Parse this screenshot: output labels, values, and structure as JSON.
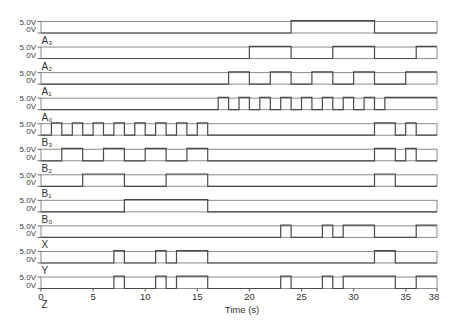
{
  "chart_data": {
    "type": "line",
    "style": "digital-step",
    "title": "",
    "xlabel": "Time (s)",
    "ylabel": "",
    "xlim": [
      0,
      38
    ],
    "xticks": [
      0,
      5,
      10,
      15,
      20,
      25,
      30,
      35,
      38
    ],
    "xtick_labels": [
      "0",
      "5",
      "10",
      "15",
      "20",
      "25",
      "30",
      "35",
      "38"
    ],
    "grid": false,
    "legend": null,
    "y_level_labels": {
      "high": "5.0V",
      "low": "0V"
    },
    "levels_V": {
      "high": 5.0,
      "low": 0
    },
    "series": [
      {
        "id": "A3",
        "name": "A₃",
        "high_intervals": [
          [
            24,
            32
          ]
        ]
      },
      {
        "id": "A2",
        "name": "A₂",
        "high_intervals": [
          [
            20,
            24
          ],
          [
            28,
            32
          ],
          [
            36,
            38
          ]
        ]
      },
      {
        "id": "A1",
        "name": "A₁",
        "high_intervals": [
          [
            18,
            20
          ],
          [
            22,
            24
          ],
          [
            26,
            28
          ],
          [
            30,
            32
          ],
          [
            35,
            38
          ]
        ]
      },
      {
        "id": "A0",
        "name": "A₀",
        "high_intervals": [
          [
            17,
            18
          ],
          [
            19,
            20
          ],
          [
            21,
            22
          ],
          [
            23,
            24
          ],
          [
            25,
            26
          ],
          [
            27,
            28
          ],
          [
            29,
            30
          ],
          [
            31,
            32
          ],
          [
            33,
            38
          ]
        ]
      },
      {
        "id": "B3",
        "name": "B₃",
        "high_intervals": [
          [
            1,
            2
          ],
          [
            3,
            4
          ],
          [
            5,
            6
          ],
          [
            7,
            8
          ],
          [
            9,
            10
          ],
          [
            11,
            12
          ],
          [
            13,
            14
          ],
          [
            15,
            16
          ],
          [
            32,
            34
          ],
          [
            35,
            36
          ]
        ]
      },
      {
        "id": "B2",
        "name": "B₂",
        "high_intervals": [
          [
            2,
            4
          ],
          [
            6,
            8
          ],
          [
            10,
            12
          ],
          [
            14,
            16
          ],
          [
            32,
            34
          ],
          [
            35,
            36
          ]
        ]
      },
      {
        "id": "B1",
        "name": "B₁",
        "high_intervals": [
          [
            4,
            8
          ],
          [
            12,
            16
          ],
          [
            32,
            34
          ]
        ]
      },
      {
        "id": "B0",
        "name": "B₀",
        "high_intervals": [
          [
            8,
            16
          ]
        ]
      },
      {
        "id": "X",
        "name": "X",
        "high_intervals": [
          [
            23,
            24
          ],
          [
            27,
            28
          ],
          [
            29,
            32
          ],
          [
            36,
            38
          ]
        ]
      },
      {
        "id": "Y",
        "name": "Y",
        "high_intervals": [
          [
            7,
            8
          ],
          [
            11,
            12
          ],
          [
            13,
            16
          ],
          [
            32,
            34
          ]
        ]
      },
      {
        "id": "Z",
        "name": "Z",
        "high_intervals": [
          [
            7,
            8
          ],
          [
            11,
            12
          ],
          [
            13,
            16
          ],
          [
            23,
            24
          ],
          [
            27,
            28
          ],
          [
            29,
            34
          ],
          [
            36,
            38
          ]
        ]
      }
    ]
  }
}
